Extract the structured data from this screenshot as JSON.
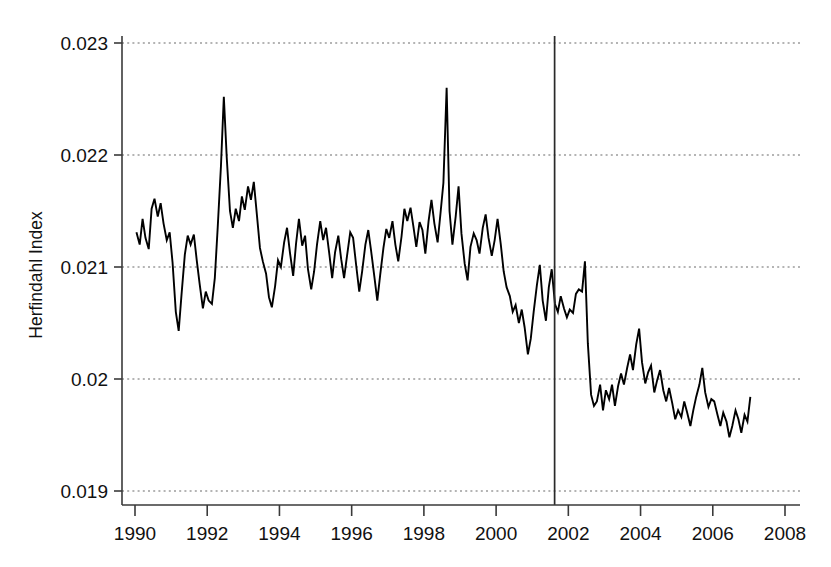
{
  "chart_data": {
    "type": "line",
    "title": "",
    "subtitle": "",
    "xlabel": "",
    "ylabel": "Herfindahl Index",
    "xlim": [
      1989.6,
      2008.5
    ],
    "ylim": [
      0.019,
      0.023
    ],
    "grid": true,
    "legend": null,
    "legend_position": "none",
    "x_ticks": [
      1990,
      1992,
      1994,
      1996,
      1998,
      2000,
      2002,
      2004,
      2006,
      2008
    ],
    "x_tick_labels": [
      "1990",
      "1992",
      "1994",
      "1996",
      "1998",
      "2000",
      "2002",
      "2004",
      "2006",
      "2008"
    ],
    "y_ticks": [
      0.019,
      0.02,
      0.021,
      0.022,
      0.023
    ],
    "y_tick_labels": [
      "0.019",
      "0.02",
      "0.021",
      "0.022",
      "0.023"
    ],
    "annotations": [
      {
        "name": "vertical-event-line",
        "type": "vline",
        "x": 2001.62,
        "label": ""
      }
    ],
    "series": [
      {
        "name": "Herfindahl Index",
        "color": "#000000",
        "x": [
          1990.04,
          1990.13,
          1990.21,
          1990.29,
          1990.38,
          1990.46,
          1990.54,
          1990.63,
          1990.71,
          1990.79,
          1990.88,
          1990.96,
          1991.04,
          1991.13,
          1991.21,
          1991.29,
          1991.38,
          1991.46,
          1991.54,
          1991.63,
          1991.71,
          1991.79,
          1991.88,
          1991.96,
          1992.04,
          1992.13,
          1992.21,
          1992.29,
          1992.38,
          1992.46,
          1992.54,
          1992.63,
          1992.71,
          1992.79,
          1992.88,
          1992.96,
          1993.04,
          1993.13,
          1993.21,
          1993.29,
          1993.38,
          1993.46,
          1993.54,
          1993.63,
          1993.71,
          1993.79,
          1993.88,
          1993.96,
          1994.04,
          1994.13,
          1994.21,
          1994.29,
          1994.38,
          1994.46,
          1994.54,
          1994.63,
          1994.71,
          1994.79,
          1994.88,
          1994.96,
          1995.04,
          1995.13,
          1995.21,
          1995.29,
          1995.38,
          1995.46,
          1995.54,
          1995.63,
          1995.71,
          1995.79,
          1995.88,
          1995.96,
          1996.04,
          1996.13,
          1996.21,
          1996.29,
          1996.38,
          1996.46,
          1996.54,
          1996.63,
          1996.71,
          1996.79,
          1996.88,
          1996.96,
          1997.04,
          1997.13,
          1997.21,
          1997.29,
          1997.38,
          1997.46,
          1997.54,
          1997.63,
          1997.71,
          1997.79,
          1997.88,
          1997.96,
          1998.04,
          1998.13,
          1998.21,
          1998.29,
          1998.38,
          1998.46,
          1998.54,
          1998.63,
          1998.71,
          1998.79,
          1998.88,
          1998.96,
          1999.04,
          1999.13,
          1999.21,
          1999.29,
          1999.38,
          1999.46,
          1999.54,
          1999.63,
          1999.71,
          1999.79,
          1999.88,
          1999.96,
          2000.04,
          2000.13,
          2000.21,
          2000.29,
          2000.38,
          2000.46,
          2000.54,
          2000.63,
          2000.71,
          2000.79,
          2000.88,
          2000.96,
          2001.04,
          2001.13,
          2001.21,
          2001.29,
          2001.38,
          2001.46,
          2001.54,
          2001.63,
          2001.71,
          2001.79,
          2001.88,
          2001.96,
          2002.04,
          2002.13,
          2002.21,
          2002.29,
          2002.38,
          2002.46,
          2002.54,
          2002.63,
          2002.71,
          2002.79,
          2002.88,
          2002.96,
          2003.04,
          2003.13,
          2003.21,
          2003.29,
          2003.38,
          2003.46,
          2003.54,
          2003.63,
          2003.71,
          2003.79,
          2003.88,
          2003.96,
          2004.04,
          2004.13,
          2004.21,
          2004.29,
          2004.38,
          2004.46,
          2004.54,
          2004.63,
          2004.71,
          2004.79,
          2004.88,
          2004.96,
          2005.04,
          2005.13,
          2005.21,
          2005.29,
          2005.38,
          2005.46,
          2005.54,
          2005.63,
          2005.71,
          2005.79,
          2005.88,
          2005.96,
          2006.04,
          2006.13,
          2006.21,
          2006.29,
          2006.38,
          2006.46,
          2006.54,
          2006.63,
          2006.71,
          2006.79,
          2006.88,
          2006.96,
          2007.04
        ],
        "y": [
          0.02131,
          0.0212,
          0.02143,
          0.02126,
          0.02116,
          0.02152,
          0.02161,
          0.02145,
          0.02157,
          0.02139,
          0.02124,
          0.02131,
          0.02104,
          0.0206,
          0.02043,
          0.02076,
          0.02111,
          0.02128,
          0.0212,
          0.02129,
          0.02106,
          0.02085,
          0.02063,
          0.02078,
          0.0207,
          0.02067,
          0.0209,
          0.02135,
          0.0219,
          0.02252,
          0.02198,
          0.0215,
          0.02135,
          0.02152,
          0.02141,
          0.02163,
          0.02151,
          0.02172,
          0.0216,
          0.02176,
          0.02145,
          0.02117,
          0.02105,
          0.02094,
          0.02073,
          0.02064,
          0.02083,
          0.02106,
          0.021,
          0.02122,
          0.02135,
          0.02113,
          0.02092,
          0.02121,
          0.02143,
          0.02119,
          0.02128,
          0.02098,
          0.0208,
          0.02096,
          0.0212,
          0.02141,
          0.02124,
          0.02135,
          0.02112,
          0.0209,
          0.02113,
          0.02128,
          0.02107,
          0.0209,
          0.02112,
          0.02131,
          0.02126,
          0.021,
          0.02078,
          0.02096,
          0.0212,
          0.02133,
          0.02114,
          0.02091,
          0.0207,
          0.02093,
          0.02117,
          0.02134,
          0.02126,
          0.02141,
          0.0212,
          0.02105,
          0.02127,
          0.02152,
          0.02141,
          0.02153,
          0.02136,
          0.02118,
          0.0214,
          0.02133,
          0.02112,
          0.02141,
          0.0216,
          0.02139,
          0.02122,
          0.02148,
          0.02175,
          0.0226,
          0.0215,
          0.0212,
          0.02145,
          0.02172,
          0.0213,
          0.02103,
          0.02088,
          0.02118,
          0.0213,
          0.02124,
          0.02112,
          0.02135,
          0.02147,
          0.02126,
          0.0211,
          0.02124,
          0.02143,
          0.0212,
          0.02096,
          0.02082,
          0.02074,
          0.0206,
          0.02066,
          0.0205,
          0.02062,
          0.02046,
          0.02022,
          0.02036,
          0.0206,
          0.02084,
          0.02102,
          0.0207,
          0.02052,
          0.02082,
          0.02098,
          0.02067,
          0.0206,
          0.02074,
          0.02063,
          0.02055,
          0.02062,
          0.02059,
          0.02076,
          0.0208,
          0.02078,
          0.02105,
          0.02032,
          0.01986,
          0.01976,
          0.0198,
          0.01995,
          0.01972,
          0.0199,
          0.01982,
          0.01995,
          0.01976,
          0.01994,
          0.02005,
          0.01995,
          0.0201,
          0.02022,
          0.02008,
          0.02031,
          0.02045,
          0.02015,
          0.01996,
          0.02006,
          0.02012,
          0.01988,
          0.01999,
          0.02008,
          0.0199,
          0.0198,
          0.01992,
          0.01978,
          0.01964,
          0.01972,
          0.01966,
          0.0198,
          0.0197,
          0.01958,
          0.01972,
          0.01984,
          0.01995,
          0.0201,
          0.01988,
          0.01975,
          0.01982,
          0.0198,
          0.01968,
          0.01958,
          0.0197,
          0.01962,
          0.01948,
          0.01958,
          0.01972,
          0.01964,
          0.01952,
          0.01968,
          0.01962,
          0.01984
        ]
      }
    ]
  },
  "axes": {
    "ylabel": "Herfindahl Index"
  }
}
